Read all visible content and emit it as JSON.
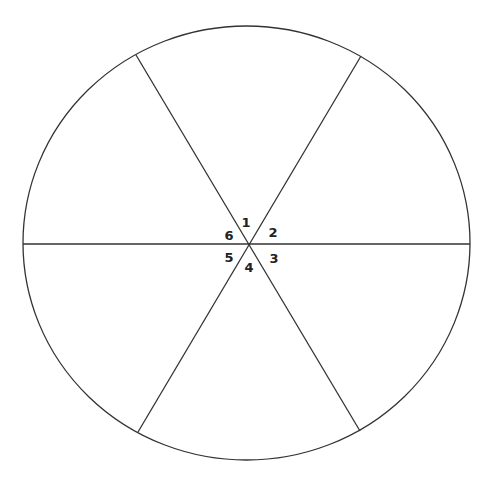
{
  "diagram": {
    "type": "circle-divided-into-sectors",
    "sector_count": 6,
    "stroke_color": "#333333",
    "background": "#ffffff",
    "labels": [
      {
        "id": "1",
        "text": "1"
      },
      {
        "id": "2",
        "text": "2"
      },
      {
        "id": "3",
        "text": "3"
      },
      {
        "id": "4",
        "text": "4"
      },
      {
        "id": "5",
        "text": "5"
      },
      {
        "id": "6",
        "text": "6"
      }
    ]
  }
}
